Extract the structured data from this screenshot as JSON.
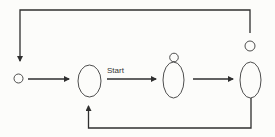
{
  "diagram": {
    "type": "flow-cycle",
    "colors": {
      "stroke": "#2f2f2f",
      "background": "#fcfcfa"
    },
    "nodes": [
      {
        "id": "node-1",
        "shape": "small-circle",
        "cx": 18.5,
        "cy": 78.5,
        "r": 4.5
      },
      {
        "id": "node-2",
        "shape": "ellipse",
        "cx": 89.5,
        "cy": 81,
        "rx": 11.5,
        "ry": 16
      },
      {
        "id": "node-3",
        "shape": "ellipse-with-small-circle-on-top",
        "cx": 173.5,
        "cy": 80,
        "rx": 10.5,
        "ry": 18,
        "top_circle": {
          "cx": 174,
          "cy": 58,
          "r": 4.5
        }
      },
      {
        "id": "node-4",
        "shape": "ellipse-with-separate-small-circle-above",
        "cx": 250.5,
        "cy": 80,
        "rx": 10.5,
        "ry": 18,
        "top_circle": {
          "cx": 250,
          "cy": 46,
          "r": 5
        }
      }
    ],
    "edges": [
      {
        "from": "node-1",
        "to": "node-2",
        "label": ""
      },
      {
        "from": "node-2",
        "to": "node-3",
        "label": "Start"
      },
      {
        "from": "node-3",
        "to": "node-4",
        "label": ""
      },
      {
        "from": "node-4",
        "to": "node-1",
        "label": "",
        "route": "over-top"
      },
      {
        "from": "node-4",
        "to": "node-2",
        "label": "",
        "route": "under-bottom"
      }
    ],
    "edge_labels": {
      "start": "Start"
    }
  }
}
